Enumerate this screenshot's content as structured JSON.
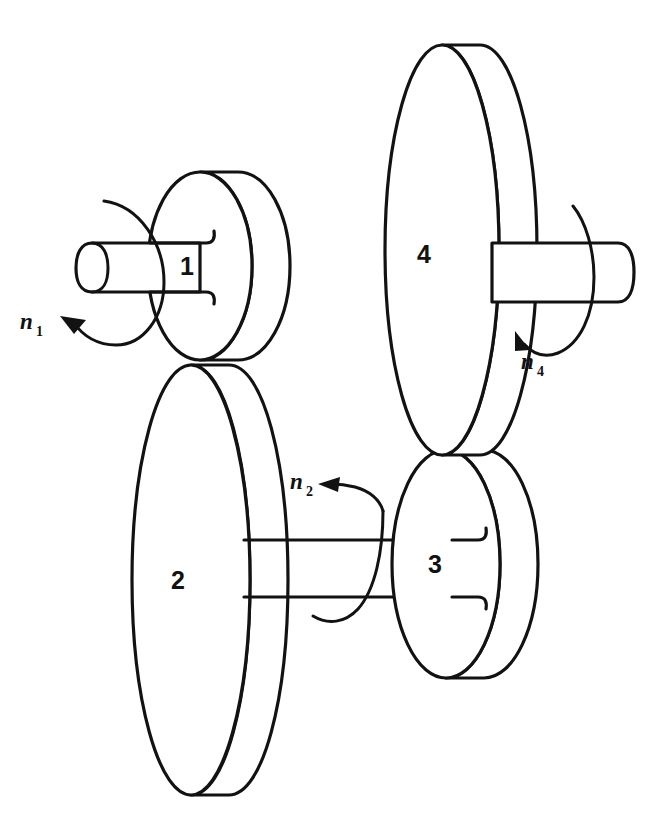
{
  "diagram": {
    "type": "gear-train-schematic",
    "background_color": "#ffffff",
    "line_color": "#121212",
    "gears": [
      {
        "id": "gear-1",
        "label": "1",
        "role": "input pinion",
        "center_x": 200,
        "center_y": 266,
        "radius_x": 52,
        "radius_y": 94,
        "thickness": 38,
        "shaft": "left",
        "meshes_with": "2"
      },
      {
        "id": "gear-2",
        "label": "2",
        "role": "driven wheel",
        "center_x": 191,
        "center_y": 580,
        "radius_x": 59,
        "radius_y": 215,
        "thickness": 38,
        "shaft": "right",
        "meshes_with": "1"
      },
      {
        "id": "gear-3",
        "label": "3",
        "role": "driver pinion",
        "center_x": 446,
        "center_y": 564,
        "radius_x": 54,
        "radius_y": 114,
        "thickness": 38,
        "shaft": "left",
        "meshes_with": "4"
      },
      {
        "id": "gear-4",
        "label": "4",
        "role": "output wheel",
        "center_x": 442,
        "center_y": 250,
        "radius_x": 57,
        "radius_y": 205,
        "thickness": 38,
        "shaft": "right",
        "meshes_with": "3"
      }
    ],
    "mesh_points": [
      {
        "id": "mesh-1-2",
        "between": [
          "1",
          "2"
        ],
        "x": 200,
        "y": 362
      },
      {
        "id": "mesh-4-3",
        "between": [
          "4",
          "3"
        ],
        "x": 442,
        "y": 455
      }
    ],
    "shafts": [
      {
        "id": "shaft-1",
        "attached_to": "1",
        "side": "left",
        "x_start": 78,
        "x_end": 200,
        "y_top": 243,
        "y_bottom": 292,
        "capped_end": true
      },
      {
        "id": "shaft-2-3",
        "attached_to": "2",
        "side": "right",
        "x_start": 244,
        "x_end": 452,
        "y_top": 540,
        "y_bottom": 597,
        "capped_end": false
      },
      {
        "id": "shaft-4",
        "attached_to": "4",
        "side": "right",
        "x_start": 492,
        "x_end": 632,
        "y_top": 243,
        "y_bottom": 302,
        "capped_end": true
      }
    ],
    "speed_labels": [
      {
        "id": "n1",
        "symbol": "n",
        "subscript": "1",
        "text_x": 20,
        "text_y": 329,
        "gear": "1",
        "direction": "counter-clockwise",
        "arrowhead_x": 62,
        "arrowhead_y": 323
      },
      {
        "id": "n2",
        "symbol": "n",
        "subscript": "2",
        "text_x": 290,
        "text_y": 489,
        "gear": "2",
        "direction": "counter-clockwise",
        "arrowhead_x": 326,
        "arrowhead_y": 485
      },
      {
        "id": "n4",
        "symbol": "n",
        "subscript": "4",
        "text_x": 521,
        "text_y": 369,
        "gear": "4",
        "direction": "counter-clockwise",
        "arrowhead_x": 526,
        "arrowhead_y": 334
      }
    ]
  }
}
